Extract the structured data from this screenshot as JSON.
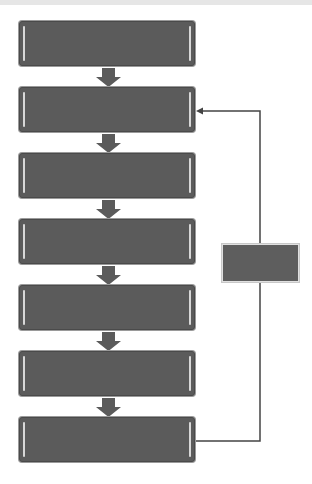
{
  "diagram": {
    "type": "flowchart",
    "colors": {
      "box_fill": "#5b5b5b",
      "box_border": "#4a4a4a",
      "arrow_fill": "#5b5b5b",
      "connector": "#444444",
      "background": "#ffffff"
    },
    "steps": [
      {
        "label": ""
      },
      {
        "label": ""
      },
      {
        "label": ""
      },
      {
        "label": ""
      },
      {
        "label": ""
      },
      {
        "label": ""
      },
      {
        "label": ""
      }
    ],
    "feedback_box": {
      "label": ""
    },
    "feedback_loop": {
      "from_step": 7,
      "to_step": 2
    }
  }
}
